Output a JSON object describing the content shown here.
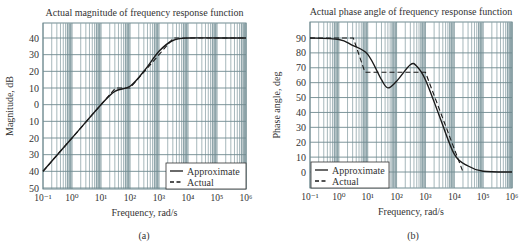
{
  "figure": {
    "captions": [
      "(a)",
      "(b)"
    ]
  },
  "chart_data": [
    {
      "type": "line",
      "title": "Actual magnitude of frequency response function",
      "xlabel": "Frequency, rad/s",
      "ylabel": "Magnitude, dB",
      "xscale": "log",
      "xlim": [
        0.1,
        1000000
      ],
      "x_tick_labels": [
        "10⁻¹",
        "10⁰",
        "10¹",
        "10²",
        "10³",
        "10⁴",
        "10⁵",
        "10⁶"
      ],
      "y_tick_labels": [
        "40",
        "30",
        "20",
        "10",
        "0",
        "10",
        "20",
        "30",
        "40",
        "50"
      ],
      "ylim": [
        -50,
        40
      ],
      "grid": true,
      "legend": {
        "position": "lower right",
        "entries": [
          "Approximate",
          "Actual"
        ]
      },
      "series": [
        {
          "name": "Approximate",
          "style": "solid",
          "x": [
            0.1,
            1,
            10,
            30,
            100,
            300,
            1000,
            3000,
            10000,
            100000,
            1000000
          ],
          "y": [
            -40,
            -20,
            0,
            8,
            11,
            20,
            32,
            38.5,
            40,
            40,
            40
          ]
        },
        {
          "name": "Actual",
          "style": "dashed",
          "x": [
            0.1,
            1,
            10,
            31.6,
            100,
            1000,
            3162,
            1000000
          ],
          "y": [
            -40,
            -20,
            0,
            10,
            10,
            30,
            40,
            40
          ]
        }
      ]
    },
    {
      "type": "line",
      "title": "Actual phase angle of frequency response function",
      "xlabel": "Frequency, rad/s",
      "ylabel": "Phase angle, deg",
      "xscale": "log",
      "xlim": [
        0.1,
        1000000
      ],
      "x_tick_labels": [
        "10⁻¹",
        "10⁰",
        "10¹",
        "10²",
        "10³",
        "10⁴",
        "10⁵",
        "10⁶"
      ],
      "y_tick_labels": [
        "90",
        "80",
        "70",
        "60",
        "50",
        "40",
        "30",
        "20",
        "10",
        "0"
      ],
      "ylim": [
        -10,
        100
      ],
      "grid": true,
      "legend": {
        "position": "lower left",
        "entries": [
          "Approximate",
          "Actual"
        ]
      },
      "series": [
        {
          "name": "Approximate",
          "style": "solid",
          "x": [
            0.1,
            1,
            3,
            10,
            30,
            50,
            100,
            300,
            500,
            1000,
            3000,
            10000,
            30000,
            100000,
            1000000
          ],
          "y": [
            90,
            89,
            85,
            79,
            62,
            56.5,
            61,
            72,
            71,
            62,
            38,
            12,
            4,
            0.5,
            0
          ]
        },
        {
          "name": "Actual",
          "style": "dashed",
          "x": [
            0.1,
            3.16,
            8,
            1000,
            20000
          ],
          "y": [
            90,
            90,
            67,
            67,
            0
          ]
        }
      ]
    }
  ]
}
